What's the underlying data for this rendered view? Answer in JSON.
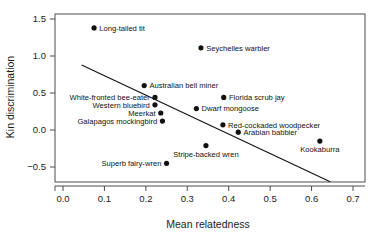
{
  "chart_data": {
    "type": "scatter",
    "title": "",
    "xlabel": "Mean relatedness",
    "ylabel": "Kin discrimination",
    "xlim": [
      0.0,
      0.7
    ],
    "ylim": [
      -0.5,
      1.5
    ],
    "xticks": [
      "0.0",
      "0.1",
      "0.2",
      "0.3",
      "0.4",
      "0.5",
      "0.6",
      "0.7"
    ],
    "xtick_values": [
      0.0,
      0.1,
      0.2,
      0.3,
      0.4,
      0.5,
      0.6,
      0.7
    ],
    "yticks": [
      "1.5",
      "1.0",
      "0.5",
      "0.0",
      "−0.5"
    ],
    "ytick_values": [
      1.5,
      1.0,
      0.5,
      0.0,
      -0.5
    ],
    "grid": false,
    "legend": null,
    "marker": "filled-circle",
    "marker_color": "#111111",
    "line_color": "#111111",
    "frame": true,
    "points": [
      {
        "label": "Long-tailed tit",
        "x": 0.075,
        "y": 1.38,
        "label_pos": "right"
      },
      {
        "label": "Seychelles warbler",
        "x": 0.333,
        "y": 1.11,
        "label_pos": "right"
      },
      {
        "label": "Australian bell miner",
        "x": 0.196,
        "y": 0.6,
        "label_pos": "right"
      },
      {
        "label": "White-fronted bee-eater",
        "x": 0.222,
        "y": 0.44,
        "label_pos": "left"
      },
      {
        "label": "Western bluebird",
        "x": 0.222,
        "y": 0.34,
        "label_pos": "left"
      },
      {
        "label": "Meerkat",
        "x": 0.236,
        "y": 0.23,
        "label_pos": "left"
      },
      {
        "label": "Galapagos mockingbird",
        "x": 0.24,
        "y": 0.12,
        "label_pos": "left"
      },
      {
        "label": "Florida scrub jay",
        "x": 0.388,
        "y": 0.44,
        "label_pos": "right"
      },
      {
        "label": "Dwarf mongoose",
        "x": 0.322,
        "y": 0.29,
        "label_pos": "right"
      },
      {
        "label": "Red-cockaded woodpecker",
        "x": 0.386,
        "y": 0.07,
        "label_pos": "right"
      },
      {
        "label": "Arabian babbler",
        "x": 0.423,
        "y": -0.03,
        "label_pos": "right"
      },
      {
        "label": "Stripe-backed wren",
        "x": 0.345,
        "y": -0.21,
        "label_pos": "below"
      },
      {
        "label": "Kookaburra",
        "x": 0.62,
        "y": -0.15,
        "label_pos": "below"
      },
      {
        "label": "Superb fairy-wren",
        "x": 0.25,
        "y": -0.45,
        "label_pos": "left"
      }
    ],
    "trend_line": {
      "x_start": 0.045,
      "y_start": 0.88,
      "x_end": 0.645,
      "y_end": -0.7,
      "slope": -2.633,
      "intercept": 0.998
    }
  }
}
